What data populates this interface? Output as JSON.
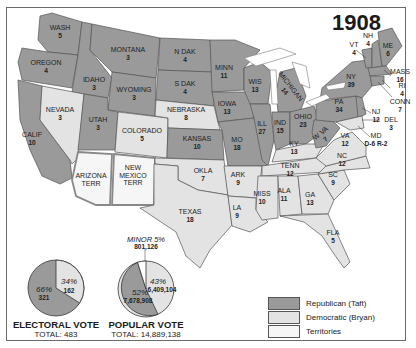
{
  "title": "1908",
  "colors": {
    "republican": "#9a9a9a",
    "democratic": "#e3e3e3",
    "territory": "#f6f6f6",
    "border": "#555555",
    "water": "#ffffff"
  },
  "states": [
    {
      "name": "WASH",
      "votes": "5",
      "party": "republican"
    },
    {
      "name": "OREGON",
      "votes": "4",
      "party": "republican"
    },
    {
      "name": "CALIF",
      "votes": "10",
      "party": "republican"
    },
    {
      "name": "IDAHO",
      "votes": "3",
      "party": "republican"
    },
    {
      "name": "NEVADA",
      "votes": "3",
      "party": "democratic"
    },
    {
      "name": "MONTANA",
      "votes": "3",
      "party": "republican"
    },
    {
      "name": "WYOMING",
      "votes": "3",
      "party": "republican"
    },
    {
      "name": "UTAH",
      "votes": "3",
      "party": "republican"
    },
    {
      "name": "COLORADO",
      "votes": "5",
      "party": "democratic"
    },
    {
      "name": "ARIZONA TERR",
      "votes": "",
      "party": "territory"
    },
    {
      "name": "NEW MEXICO TERR",
      "votes": "",
      "party": "territory"
    },
    {
      "name": "N DAK",
      "votes": "4",
      "party": "republican"
    },
    {
      "name": "S DAK",
      "votes": "4",
      "party": "republican"
    },
    {
      "name": "NEBRASKA",
      "votes": "8",
      "party": "democratic"
    },
    {
      "name": "KANSAS",
      "votes": "10",
      "party": "republican"
    },
    {
      "name": "OKLA",
      "votes": "7",
      "party": "democratic"
    },
    {
      "name": "TEXAS",
      "votes": "18",
      "party": "democratic"
    },
    {
      "name": "MINN",
      "votes": "11",
      "party": "republican"
    },
    {
      "name": "IOWA",
      "votes": "13",
      "party": "republican"
    },
    {
      "name": "MO",
      "votes": "18",
      "party": "republican"
    },
    {
      "name": "ARK",
      "votes": "9",
      "party": "democratic"
    },
    {
      "name": "LA",
      "votes": "9",
      "party": "democratic"
    },
    {
      "name": "WIS",
      "votes": "13",
      "party": "republican"
    },
    {
      "name": "ILL",
      "votes": "27",
      "party": "republican"
    },
    {
      "name": "MICHIGAN",
      "votes": "14",
      "party": "republican"
    },
    {
      "name": "IND",
      "votes": "15",
      "party": "republican"
    },
    {
      "name": "OHIO",
      "votes": "23",
      "party": "republican"
    },
    {
      "name": "KY",
      "votes": "13",
      "party": "democratic"
    },
    {
      "name": "TENN",
      "votes": "12",
      "party": "democratic"
    },
    {
      "name": "MISS",
      "votes": "10",
      "party": "democratic"
    },
    {
      "name": "ALA",
      "votes": "11",
      "party": "democratic"
    },
    {
      "name": "GA",
      "votes": "13",
      "party": "democratic"
    },
    {
      "name": "FLA",
      "votes": "5",
      "party": "democratic"
    },
    {
      "name": "SC",
      "votes": "9",
      "party": "democratic"
    },
    {
      "name": "NC",
      "votes": "12",
      "party": "democratic"
    },
    {
      "name": "VA",
      "votes": "12",
      "party": "democratic"
    },
    {
      "name": "W VA",
      "votes": "7",
      "party": "republican"
    },
    {
      "name": "PA",
      "votes": "34",
      "party": "republican"
    },
    {
      "name": "NY",
      "votes": "39",
      "party": "republican"
    },
    {
      "name": "VT",
      "votes": "4",
      "party": "republican"
    },
    {
      "name": "NH",
      "votes": "4",
      "party": "republican"
    },
    {
      "name": "ME",
      "votes": "6",
      "party": "republican"
    },
    {
      "name": "MASS",
      "votes": "16",
      "party": "republican"
    },
    {
      "name": "RI",
      "votes": "4",
      "party": "republican"
    },
    {
      "name": "CONN",
      "votes": "7",
      "party": "republican"
    },
    {
      "name": "NJ",
      "votes": "12",
      "party": "republican"
    },
    {
      "name": "DEL",
      "votes": "3",
      "party": "republican"
    },
    {
      "name": "MD",
      "votes": "D-6 R-2",
      "party": "split"
    }
  ],
  "labels": {
    "WASH": [
      "WASH",
      "5"
    ],
    "OREGON": [
      "OREGON",
      "4"
    ],
    "CALIF": [
      "CALIF",
      "10"
    ],
    "IDAHO": [
      "IDAHO",
      "3"
    ],
    "NEVADA": [
      "NEVADA",
      "3"
    ],
    "MONTANA": [
      "MONTANA",
      "3"
    ],
    "WYOMING": [
      "WYOMING",
      "3"
    ],
    "UTAH": [
      "UTAH",
      "3"
    ],
    "COLORADO": [
      "COLORADO",
      "5"
    ],
    "ARIZONA": [
      "ARIZONA",
      "TERR"
    ],
    "NEWMEXICO": [
      "NEW",
      "MEXICO",
      "TERR"
    ],
    "NDAK": [
      "N DAK",
      "4"
    ],
    "SDAK": [
      "S DAK",
      "4"
    ],
    "NEBRASKA": [
      "NEBRASKA",
      "8"
    ],
    "KANSAS": [
      "KANSAS",
      "10"
    ],
    "OKLA": [
      "OKLA",
      "7"
    ],
    "TEXAS": [
      "TEXAS",
      "18"
    ],
    "MINN": [
      "MINN",
      "11"
    ],
    "IOWA": [
      "IOWA",
      "13"
    ],
    "MO": [
      "MO",
      "18"
    ],
    "ARK": [
      "ARK",
      "9"
    ],
    "LA": [
      "LA",
      "9"
    ],
    "WIS": [
      "WIS",
      "13"
    ],
    "ILL": [
      "ILL",
      "27"
    ],
    "MICHIGAN": [
      "MICHIGAN",
      "14"
    ],
    "IND": [
      "IND",
      "15"
    ],
    "OHIO": [
      "OHIO",
      "23"
    ],
    "KY": [
      "KY",
      "13"
    ],
    "TENN": [
      "TENN",
      "12"
    ],
    "MISS": [
      "MISS",
      "10"
    ],
    "ALA": [
      "ALA",
      "11"
    ],
    "GA": [
      "GA",
      "13"
    ],
    "FLA": [
      "FLA",
      "5"
    ],
    "SC": [
      "SC",
      "9"
    ],
    "NC": [
      "NC",
      "12"
    ],
    "VA": [
      "VA",
      "12"
    ],
    "WVA": [
      "W VA",
      "7"
    ],
    "PA": [
      "PA",
      "34"
    ],
    "NY": [
      "NY",
      "39"
    ],
    "VT": [
      "VT",
      "4"
    ],
    "NH": [
      "NH",
      "4"
    ],
    "ME": [
      "ME",
      "6"
    ],
    "MASS": [
      "MASS",
      "16"
    ],
    "RI": [
      "RI",
      "4"
    ],
    "CONN": [
      "CONN",
      "7"
    ],
    "NJ": [
      "NJ",
      "12"
    ],
    "DEL": [
      "DEL",
      "3"
    ],
    "MD": [
      "MD",
      "D-6 R-2"
    ]
  },
  "electoral_vote": {
    "title": "ELECTORAL VOTE",
    "total": "TOTAL: 483",
    "republican_pct": "66%",
    "republican_votes": "321",
    "democratic_pct": "34%",
    "democratic_votes": "162"
  },
  "popular_vote": {
    "title": "POPULAR VOTE",
    "total": "TOTAL: 14,889,138",
    "republican_pct": "52%",
    "republican_votes": "7,678,908",
    "democratic_pct": "43%",
    "democratic_votes": "6,409,104",
    "minor_pct": "MINOR 5%",
    "minor_votes": "801,126"
  },
  "legend": [
    {
      "label": "Republican (Taft)",
      "key": "republican"
    },
    {
      "label": "Democratic (Bryan)",
      "key": "democratic"
    },
    {
      "label": "Territories",
      "key": "territory"
    }
  ]
}
